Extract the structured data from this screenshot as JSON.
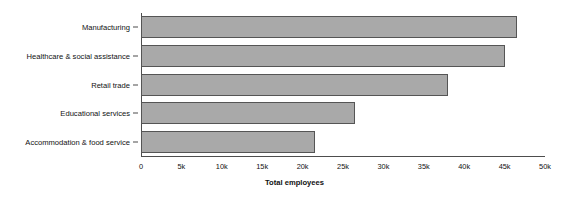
{
  "chart_data": {
    "type": "bar",
    "orientation": "horizontal",
    "title": "",
    "xlabel": "Total employees",
    "ylabel": "",
    "categories": [
      "Manufacturing",
      "Healthcare & social assistance",
      "Retail trade",
      "Educational services",
      "Accommodation & food service"
    ],
    "values": [
      46500,
      45000,
      38000,
      26500,
      21500
    ],
    "xlim": [
      0,
      50000
    ],
    "xticks": [
      0,
      5000,
      10000,
      15000,
      20000,
      25000,
      30000,
      35000,
      40000,
      45000,
      50000
    ],
    "xtick_labels": [
      "0",
      "5k",
      "10k",
      "15k",
      "20k",
      "25k",
      "30k",
      "35k",
      "40k",
      "45k",
      "50k"
    ],
    "grid": false,
    "legend": false,
    "bar_color": "#a9a9a9",
    "bar_edge_color": "#555555",
    "axis_color": "#4d4d4d",
    "background": "#ffffff"
  }
}
